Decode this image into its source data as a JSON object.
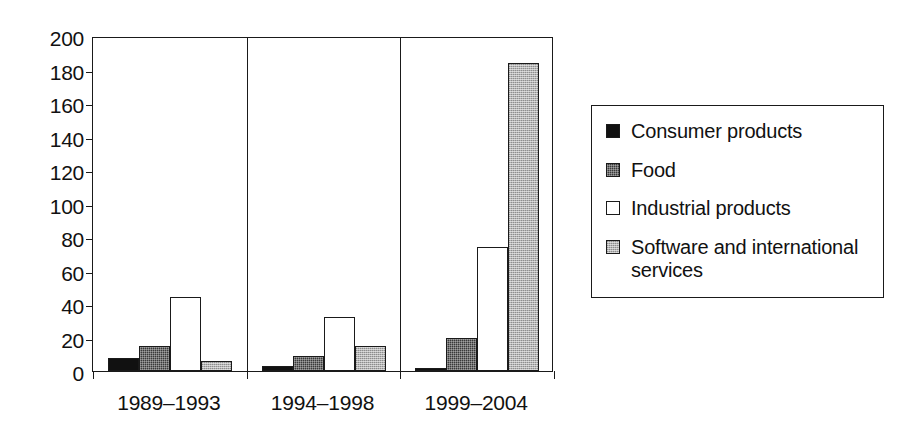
{
  "chart_data": {
    "type": "bar",
    "title": "",
    "xlabel": "",
    "ylabel": "",
    "ylim": [
      0,
      200
    ],
    "ytick_step": 20,
    "yticks": [
      "200",
      "180",
      "160",
      "140",
      "120",
      "100",
      "80",
      "60",
      "40",
      "20",
      "0"
    ],
    "ytick_values": [
      200,
      180,
      160,
      140,
      120,
      100,
      80,
      60,
      40,
      20,
      0
    ],
    "grid": false,
    "legend_position": "right",
    "categories": [
      "1989–1993",
      "1994–1998",
      "1999–2004"
    ],
    "series": [
      {
        "name": "Consumer products",
        "values": [
          8,
          3,
          2
        ],
        "swatch": "sw-consumer",
        "color": "#111111"
      },
      {
        "name": "Food",
        "values": [
          15,
          9,
          20
        ],
        "swatch": "sw-food",
        "color": "#3a3a3a"
      },
      {
        "name": "Industrial products",
        "values": [
          44,
          32,
          74
        ],
        "swatch": "sw-industrial",
        "color": "#ffffff"
      },
      {
        "name": "Software and international services",
        "values": [
          6,
          15,
          184
        ],
        "swatch": "sw-software",
        "color": "#b4b4b4"
      }
    ]
  },
  "legend": {
    "items": [
      {
        "label": "Consumer products"
      },
      {
        "label": "Food"
      },
      {
        "label": "Industrial products"
      },
      {
        "label": "Software and international services"
      }
    ]
  }
}
